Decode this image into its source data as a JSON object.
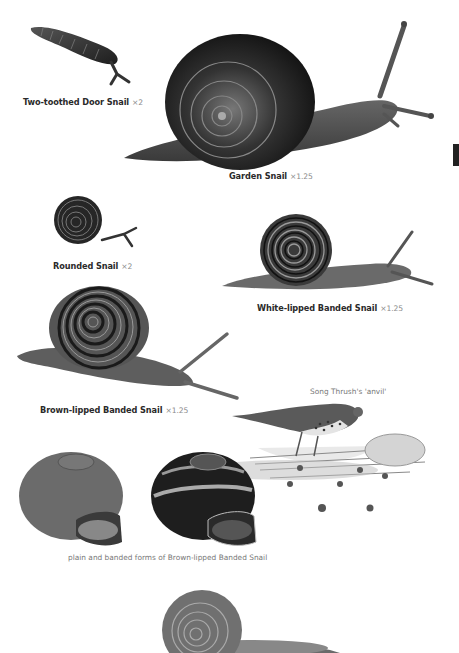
{
  "page": {
    "background": "#ffffff",
    "edge_tab_color": "#222222"
  },
  "illustrations": [
    {
      "id": "two-toothed-door-snail",
      "name": "Two-toothed Door Snail",
      "scale": "×2"
    },
    {
      "id": "garden-snail",
      "name": "Garden Snail",
      "scale": "×1.25"
    },
    {
      "id": "rounded-snail",
      "name": "Rounded Snail",
      "scale": "×2"
    },
    {
      "id": "white-lipped-banded-snail",
      "name": "White-lipped Banded Snail",
      "scale": "×1.25"
    },
    {
      "id": "brown-lipped-banded-snail",
      "name": "Brown-lipped Banded Snail",
      "scale": "×1.25"
    }
  ],
  "notes": {
    "thrush_anvil": "Song Thrush's 'anvil'",
    "shell_forms": "plain and banded forms of Brown-lipped Banded Snail"
  }
}
